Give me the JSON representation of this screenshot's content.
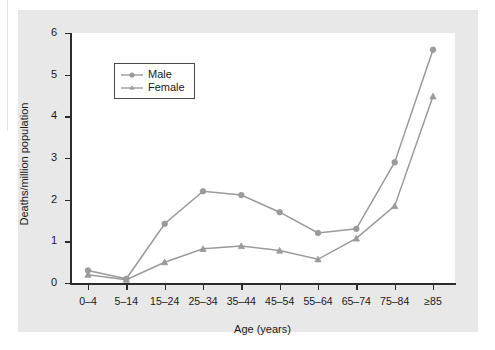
{
  "chart_data": {
    "type": "line",
    "title": "",
    "subtitle": "",
    "xlabel": "Age (years)",
    "ylabel": "Deaths/million population",
    "categories": [
      "0–4",
      "5–14",
      "15–24",
      "25–34",
      "35–44",
      "45–54",
      "55–64",
      "65–74",
      "75–84",
      "≥85"
    ],
    "series": [
      {
        "name": "Male",
        "marker": "circle",
        "color": "#9a9a9a",
        "values": [
          0.3,
          0.1,
          1.42,
          2.2,
          2.11,
          1.7,
          1.2,
          1.3,
          2.9,
          5.6
        ]
      },
      {
        "name": "Female",
        "marker": "triangle",
        "color": "#9a9a9a",
        "values": [
          0.2,
          0.08,
          0.5,
          0.82,
          0.89,
          0.78,
          0.57,
          1.07,
          1.85,
          4.48
        ]
      }
    ],
    "ylim": [
      0,
      6
    ],
    "yticks": [
      "0",
      "1",
      "2",
      "3",
      "4",
      "5",
      "6"
    ],
    "grid": false,
    "legend_position": "upper-left"
  },
  "legend": {
    "entries": [
      {
        "label": "Male"
      },
      {
        "label": "Female"
      }
    ]
  },
  "style": {
    "figure_background": "#e8e8e8",
    "plot_background": "#ffffff",
    "axis_color": "#2b2b2b",
    "series_color": "#9a9a9a",
    "text_color": "#1a1a1a"
  }
}
